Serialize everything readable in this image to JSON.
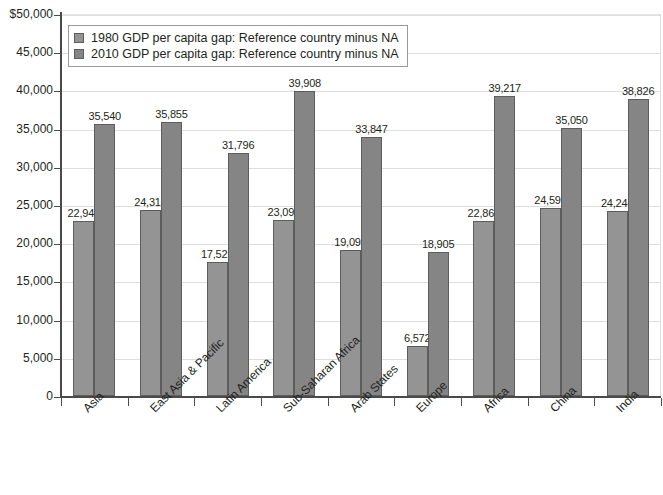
{
  "chart_data": {
    "type": "bar",
    "title": "",
    "xlabel": "",
    "ylabel": "",
    "ylim": [
      0,
      50000
    ],
    "ytick_labels": [
      "$50,000",
      "45,000",
      "40,000",
      "35,000",
      "30,000",
      "25,000",
      "20,000",
      "15,000",
      "10,000",
      "5,000",
      "0"
    ],
    "ytick_values": [
      50000,
      45000,
      40000,
      35000,
      30000,
      25000,
      20000,
      15000,
      10000,
      5000,
      0
    ],
    "grid": true,
    "legend_position": "top-left",
    "categories": [
      "Asia",
      "East Asia & Pacific",
      "Latin America",
      "Sub-Saharan Africa",
      "Arab States",
      "Europe",
      "Africa",
      "China",
      "India"
    ],
    "series": [
      {
        "name": "1980 GDP per capita gap: Reference country minus NA",
        "color": "#949494",
        "values": [
          22943,
          24316,
          17529,
          23095,
          19094,
          6572,
          22861,
          24596,
          24240
        ],
        "value_labels": [
          "22,943",
          "24,316",
          "17,529",
          "23,095",
          "19,094",
          "6,572",
          "22,861",
          "24,596",
          "24,240"
        ]
      },
      {
        "name": "2010 GDP per capita gap: Reference country minus NA",
        "color": "#858585",
        "values": [
          35540,
          35855,
          31796,
          39908,
          33847,
          18905,
          39217,
          35050,
          38826
        ],
        "value_labels": [
          "35,540",
          "35,855",
          "31,796",
          "39,908",
          "33,847",
          "18,905",
          "39,217",
          "35,050",
          "38,826"
        ]
      }
    ]
  },
  "legend": {
    "items": [
      {
        "label": "1980 GDP per capita gap: Reference country minus NA",
        "swatch": "#949494"
      },
      {
        "label": "2010 GDP per capita gap: Reference country minus NA",
        "swatch": "#858585"
      }
    ]
  }
}
